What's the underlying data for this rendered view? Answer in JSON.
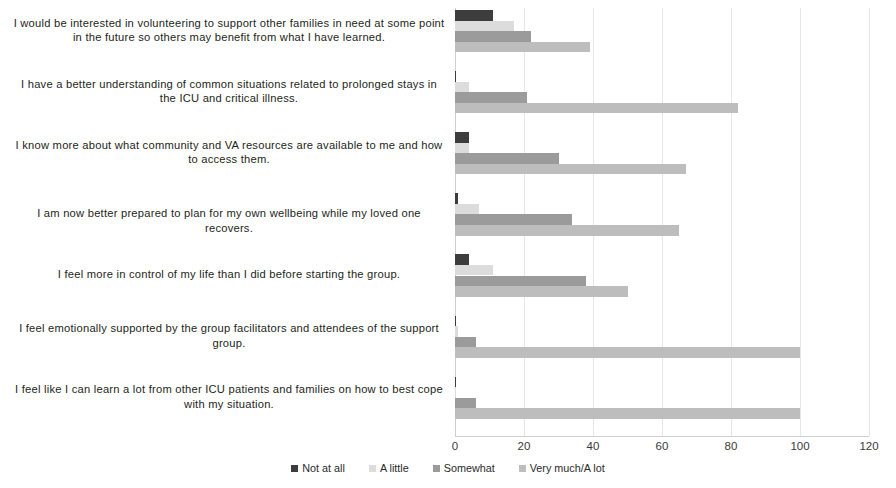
{
  "chart_data": {
    "type": "bar",
    "orientation": "horizontal",
    "title": "",
    "xlabel": "",
    "ylabel": "",
    "xlim": [
      0,
      120
    ],
    "xticks": [
      0,
      20,
      40,
      60,
      80,
      100,
      120
    ],
    "grid": true,
    "legend_position": "bottom",
    "categories": [
      "I would be interested in volunteering to support other families in need at some point in the future so others may benefit from what I have learned.",
      "I have a better understanding of common situations related to prolonged stays in the ICU and critical illness.",
      "I know more about what community and VA resources are available to me and how to access them.",
      "I am now better prepared to plan for my own wellbeing while my loved one recovers.",
      "I feel more in control of my life than I did before starting the group.",
      "I feel emotionally supported by the group facilitators and attendees of the support group.",
      "I feel like I can learn a lot from other ICU patients and families on how to best cope with my situation."
    ],
    "series": [
      {
        "name": "Not at all",
        "color": "#3d3d3d",
        "values": [
          11,
          0,
          4,
          1,
          4,
          0,
          0
        ]
      },
      {
        "name": "A little",
        "color": "#dcdcdc",
        "values": [
          17,
          4,
          4,
          7,
          11,
          1,
          0
        ]
      },
      {
        "name": "Somewhat",
        "color": "#9b9b9b",
        "values": [
          22,
          21,
          30,
          34,
          38,
          6,
          6
        ]
      },
      {
        "name": "Very much/A lot",
        "color": "#bdbdbd",
        "values": [
          39,
          82,
          67,
          65,
          50,
          100,
          100
        ]
      }
    ]
  }
}
